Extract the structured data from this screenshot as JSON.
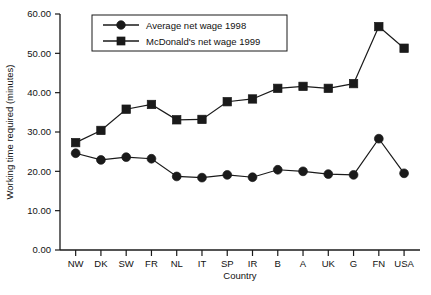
{
  "chart_data": {
    "type": "line",
    "title": "",
    "xlabel": "Country",
    "ylabel": "Working time required (minutes)",
    "categories": [
      "NW",
      "DK",
      "SW",
      "FR",
      "NL",
      "IT",
      "SP",
      "IR",
      "B",
      "A",
      "UK",
      "G",
      "FN",
      "USA"
    ],
    "ylim": [
      0,
      60
    ],
    "ytick_labels": [
      "0.00",
      "10.00",
      "20.00",
      "30.00",
      "40.00",
      "50.00",
      "60.00"
    ],
    "ytick_values": [
      0,
      10,
      20,
      30,
      40,
      50,
      60
    ],
    "grid": false,
    "legend_position": "top-left-inside",
    "series": [
      {
        "name": "Average net wage 1998",
        "marker": "circle",
        "color": "#1a1a1a",
        "values": [
          24.6,
          22.9,
          23.6,
          23.2,
          18.7,
          18.4,
          19.1,
          18.5,
          20.4,
          20.0,
          19.3,
          19.1,
          28.3,
          19.5
        ]
      },
      {
        "name": "McDonald's net wage 1999",
        "marker": "square",
        "color": "#1a1a1a",
        "values": [
          27.3,
          30.4,
          35.8,
          37.0,
          33.1,
          33.2,
          37.7,
          38.4,
          41.1,
          41.6,
          41.1,
          42.3,
          56.8,
          51.3
        ]
      }
    ]
  }
}
